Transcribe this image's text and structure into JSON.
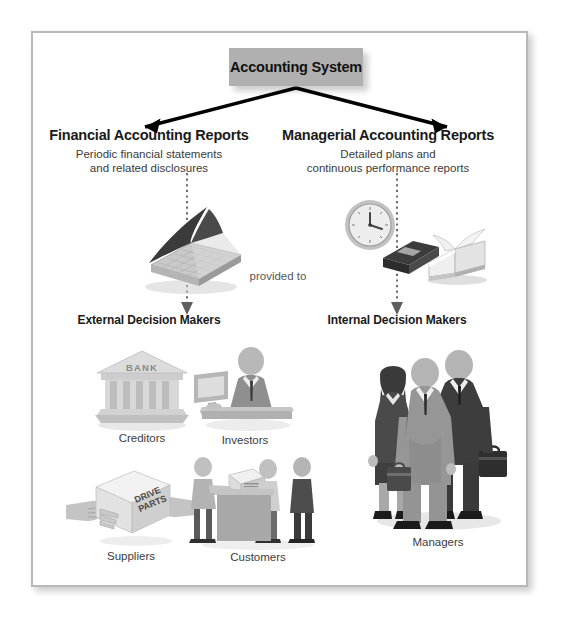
{
  "figure": {
    "title": "Accounting System",
    "provided_to": "provided to",
    "branches": [
      {
        "id": "financial",
        "heading": "Financial Accounting Reports",
        "subtitle_line1": "Periodic financial statements",
        "subtitle_line2": "and related disclosures",
        "audience": "External Decision Makers"
      },
      {
        "id": "managerial",
        "heading": "Managerial Accounting Reports",
        "subtitle_line1": "Detailed plans and",
        "subtitle_line2": "continuous performance reports",
        "audience": "Internal Decision Makers"
      }
    ],
    "external_users": [
      {
        "id": "creditors",
        "caption": "Creditors",
        "icon": "bank-building-icon",
        "sign": "BANK"
      },
      {
        "id": "investors",
        "caption": "Investors",
        "icon": "investor-at-desk-icon"
      },
      {
        "id": "suppliers",
        "caption": "Suppliers",
        "icon": "hands-holding-box-icon",
        "box_label_line1": "DRIVE",
        "box_label_line2": "PARTS"
      },
      {
        "id": "customers",
        "caption": "Customers",
        "icon": "retail-counter-icon"
      }
    ],
    "internal_users": [
      {
        "id": "managers",
        "caption": "Managers",
        "icon": "three-managers-icon"
      }
    ],
    "report_icons": {
      "financial": [
        {
          "id": "ledger",
          "name": "open-ledger-book-icon"
        }
      ],
      "managerial": [
        {
          "id": "clock",
          "name": "wall-clock-icon"
        },
        {
          "id": "planner",
          "name": "closed-planner-book-icon"
        },
        {
          "id": "openbook",
          "name": "open-book-icon"
        }
      ]
    },
    "colors": {
      "title_box": "#b0b0b0",
      "arrow": "#000000",
      "dotted_arrow": "#6e6e6e",
      "frame_border": "#b9b9b9",
      "text_dark": "#1a1a1a",
      "text_mid": "#3c3c3c"
    }
  }
}
